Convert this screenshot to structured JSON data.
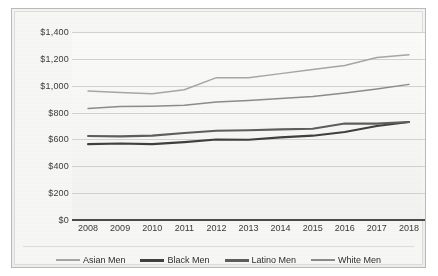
{
  "chart_data": {
    "type": "line",
    "title": "",
    "subtitle": "",
    "xlabel": "",
    "ylabel": "",
    "categories": [
      "2008",
      "2009",
      "2010",
      "2011",
      "2012",
      "2013",
      "2014",
      "2015",
      "2016",
      "2017",
      "2018"
    ],
    "ylim": [
      0,
      1400
    ],
    "ytick_values": [
      0,
      200,
      400,
      600,
      800,
      1000,
      1200,
      1400
    ],
    "ytick_labels": [
      "$0",
      "$200",
      "$400",
      "$600",
      "$800",
      "$1,000",
      "$1,200",
      "$1,400"
    ],
    "grid": true,
    "legend_position": "bottom",
    "series": [
      {
        "name": "Asian Men",
        "color": "#a6a6a6",
        "values": [
          960,
          950,
          940,
          970,
          1060,
          1060,
          1090,
          1120,
          1150,
          1210,
          1230
        ]
      },
      {
        "name": "Black Men",
        "color": "#3f3f3f",
        "values": [
          565,
          570,
          565,
          580,
          600,
          598,
          615,
          628,
          655,
          700,
          730
        ]
      },
      {
        "name": "Latino Men",
        "color": "#5e5e5e",
        "values": [
          625,
          623,
          628,
          648,
          665,
          668,
          675,
          680,
          718,
          718,
          730
        ]
      },
      {
        "name": "White Men",
        "color": "#8c8c8c",
        "values": [
          830,
          845,
          848,
          855,
          878,
          890,
          905,
          920,
          945,
          975,
          1010
        ]
      }
    ]
  },
  "legend": {
    "items": [
      {
        "label": "Asian Men",
        "color": "#a6a6a6",
        "thickness": "2px"
      },
      {
        "label": "Black Men",
        "color": "#3f3f3f",
        "thickness": "3px"
      },
      {
        "label": "Latino Men",
        "color": "#5e5e5e",
        "thickness": "3px"
      },
      {
        "label": "White Men",
        "color": "#8c8c8c",
        "thickness": "2px"
      }
    ]
  },
  "colors": {
    "frame_border": "#b9b9b7",
    "plot_background": "#f7f7f6",
    "gridline": "#d2d2d0",
    "axis": "#4b4b4b",
    "tick_text": "#3b3b3b"
  }
}
